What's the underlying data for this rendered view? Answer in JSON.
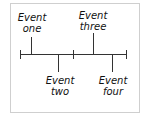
{
  "diagram": {
    "type": "timeline",
    "events": [
      {
        "label_line1": "Event",
        "label_line2": "one",
        "position": "above"
      },
      {
        "label_line1": "Event",
        "label_line2": "two",
        "position": "below"
      },
      {
        "label_line1": "Event",
        "label_line2": "three",
        "position": "above"
      },
      {
        "label_line1": "Event",
        "label_line2": "four",
        "position": "below"
      }
    ],
    "colors": {
      "line": "#333333",
      "border": "#cfcfcf",
      "text": "#111111"
    }
  }
}
